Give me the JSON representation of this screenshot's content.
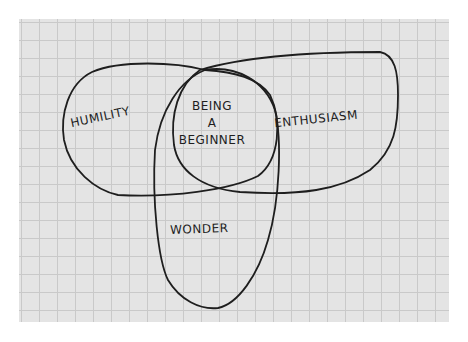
{
  "diagram": {
    "type": "venn",
    "background": "graph-paper",
    "colors": {
      "paper": "#e4e4e4",
      "grid": "#c9c9c9",
      "ink": "#1e1e1e"
    },
    "sets": [
      {
        "id": "humility",
        "label": "HUMILITY"
      },
      {
        "id": "enthusiasm",
        "label": "ENTHUSIASM"
      },
      {
        "id": "wonder",
        "label": "WONDER"
      }
    ],
    "intersection": {
      "lines": [
        "BEING",
        "A",
        "BEGINNER"
      ]
    }
  }
}
